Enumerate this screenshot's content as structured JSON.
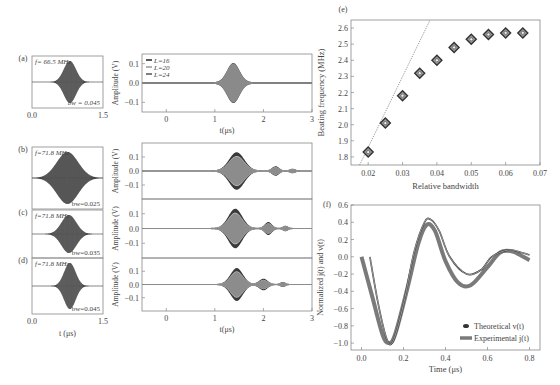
{
  "caption": "FIG. 3. (a)–(d) Wave packets and beating; (e) beating frequency vs relative bandwidth; (f) normalized theoretical and experimental pulses.",
  "chart_data": [
    {
      "id": "a-small",
      "panel_label": "(a)",
      "type": "line",
      "annotation_freq": "f= 66.5 MHz",
      "annotation_bw": "bw = 0.045",
      "xlim": [
        0.0,
        1.5
      ],
      "xticks": [
        "0.0",
        "1.5"
      ],
      "xlabel": "",
      "envelope": {
        "center": 0.8,
        "width": 0.18,
        "amplitude": 1.0
      }
    },
    {
      "id": "a-large",
      "type": "line",
      "xlabel": "t(μs)",
      "ylabel": "Amplitude (V)",
      "xlim": [
        -0.5,
        3
      ],
      "ylim": [
        -0.15,
        0.15
      ],
      "xticks": [
        "0",
        "1",
        "2",
        "3"
      ],
      "yticks": [
        "0.1",
        "0.0",
        "−0.1"
      ],
      "legend": [
        "L=16",
        "L=20",
        "L=24"
      ],
      "legend_position": "top-left",
      "packets": [
        {
          "center": 1.38,
          "width": 0.18,
          "amplitude": 0.1
        }
      ]
    },
    {
      "id": "b-small",
      "panel_label": "(b)",
      "type": "line",
      "annotation_freq": "f=71.8 MHz",
      "annotation_bw": "bw=0.025",
      "xlim": [
        0.0,
        1.5
      ],
      "envelope": {
        "center": 0.75,
        "width": 0.32,
        "amplitude": 1.0
      }
    },
    {
      "id": "b-large",
      "type": "line",
      "ylabel": "Amplitude (V)",
      "xlim": [
        -0.5,
        3
      ],
      "ylim": [
        -0.2,
        0.2
      ],
      "yticks": [
        "0.1",
        "0.0",
        "−0.1"
      ],
      "packets": [
        {
          "center": 1.45,
          "width": 0.22,
          "amplitude": 0.13
        },
        {
          "center": 2.25,
          "width": 0.1,
          "amplitude": 0.03
        },
        {
          "center": 2.6,
          "width": 0.08,
          "amplitude": 0.012
        }
      ]
    },
    {
      "id": "c-small",
      "panel_label": "(c)",
      "type": "line",
      "annotation_freq": "f=71.8 MHz",
      "annotation_bw": "bw=0.035",
      "xlim": [
        0.0,
        1.5
      ],
      "envelope": {
        "center": 0.78,
        "width": 0.22,
        "amplitude": 1.0
      }
    },
    {
      "id": "c-large",
      "type": "line",
      "ylabel": "Amplitude (V)",
      "xlim": [
        -0.5,
        3
      ],
      "ylim": [
        -0.2,
        0.2
      ],
      "yticks": [
        "0.1",
        "0.0",
        "−0.1"
      ],
      "packets": [
        {
          "center": 1.42,
          "width": 0.2,
          "amplitude": 0.13
        },
        {
          "center": 2.1,
          "width": 0.1,
          "amplitude": 0.04
        },
        {
          "center": 2.45,
          "width": 0.07,
          "amplitude": 0.015
        }
      ]
    },
    {
      "id": "d-small",
      "panel_label": "(d)",
      "type": "line",
      "annotation_freq": "f=71.8 MHz",
      "annotation_bw": "bw=0.045",
      "xlim": [
        0.0,
        1.5
      ],
      "xticks": [
        "0.0",
        "1.5"
      ],
      "xlabel": "t (μs)",
      "envelope": {
        "center": 0.8,
        "width": 0.17,
        "amplitude": 1.0
      }
    },
    {
      "id": "d-large",
      "type": "line",
      "xlabel": "t(μs)",
      "ylabel": "Amplitude (V)",
      "xlim": [
        -0.5,
        3
      ],
      "ylim": [
        -0.2,
        0.2
      ],
      "xticks": [
        "0",
        "1",
        "2",
        "3"
      ],
      "yticks": [
        "0.1",
        "0.0",
        "−0.1"
      ],
      "packets": [
        {
          "center": 1.45,
          "width": 0.18,
          "amplitude": 0.12
        },
        {
          "center": 2.0,
          "width": 0.12,
          "amplitude": 0.04
        },
        {
          "center": 2.4,
          "width": 0.07,
          "amplitude": 0.015
        }
      ]
    },
    {
      "id": "e",
      "panel_label": "(e)",
      "type": "scatter",
      "xlabel": "Relative bandwidth",
      "ylabel": "Beating frequency (MHz)",
      "xlim": [
        0.015,
        0.07
      ],
      "ylim": [
        1.75,
        2.65
      ],
      "xticks": [
        "0.02",
        "0.03",
        "0.04",
        "0.05",
        "0.06",
        "0.07"
      ],
      "yticks": [
        "1.8",
        "1.9",
        "2.0",
        "2.1",
        "2.2",
        "2.3",
        "2.4",
        "2.5",
        "2.6"
      ],
      "x": [
        0.02,
        0.025,
        0.03,
        0.035,
        0.04,
        0.045,
        0.05,
        0.055,
        0.06,
        0.065
      ],
      "y": [
        1.83,
        2.01,
        2.18,
        2.32,
        2.4,
        2.48,
        2.53,
        2.56,
        2.57,
        2.57
      ],
      "fit_line": {
        "x": [
          0.0175,
          0.038
        ],
        "y": [
          1.75,
          2.65
        ],
        "style": "dotted"
      }
    },
    {
      "id": "f",
      "panel_label": "(f)",
      "type": "line",
      "xlabel": "Time (μs)",
      "ylabel": "Normalized j(t) and v(t)",
      "xlim": [
        -0.05,
        0.85
      ],
      "ylim": [
        -1.08,
        0.6
      ],
      "xticks": [
        "0.0",
        "0.2",
        "0.4",
        "0.6",
        "0.8"
      ],
      "yticks": [
        "0.6",
        "0.4",
        "0.2",
        "0.0",
        "−0.2",
        "−0.4",
        "−0.6",
        "−0.8",
        "−1.0"
      ],
      "legend": [
        "Theoretical v(t)",
        "Experimental j(t)"
      ],
      "legend_position": "bottom-right",
      "series": [
        {
          "name": "Theoretical v(t)",
          "x": [
            0.04,
            0.08,
            0.12,
            0.15,
            0.2,
            0.25,
            0.3,
            0.33,
            0.37,
            0.42,
            0.5,
            0.57,
            0.62,
            0.7,
            0.76,
            0.8
          ],
          "y": [
            0.0,
            -0.55,
            -0.95,
            -0.98,
            -0.55,
            0.05,
            0.4,
            0.43,
            0.3,
            0.0,
            -0.2,
            -0.15,
            0.0,
            0.08,
            0.05,
            0.02
          ]
        },
        {
          "name": "Experimental j(t)",
          "x": [
            0.0,
            0.05,
            0.1,
            0.13,
            0.16,
            0.22,
            0.27,
            0.31,
            0.35,
            0.4,
            0.46,
            0.52,
            0.6,
            0.66,
            0.72,
            0.8
          ],
          "y": [
            0.0,
            -0.45,
            -0.9,
            -1.0,
            -0.9,
            -0.35,
            0.15,
            0.37,
            0.3,
            -0.05,
            -0.3,
            -0.33,
            -0.12,
            0.05,
            0.06,
            -0.04
          ]
        }
      ]
    }
  ]
}
